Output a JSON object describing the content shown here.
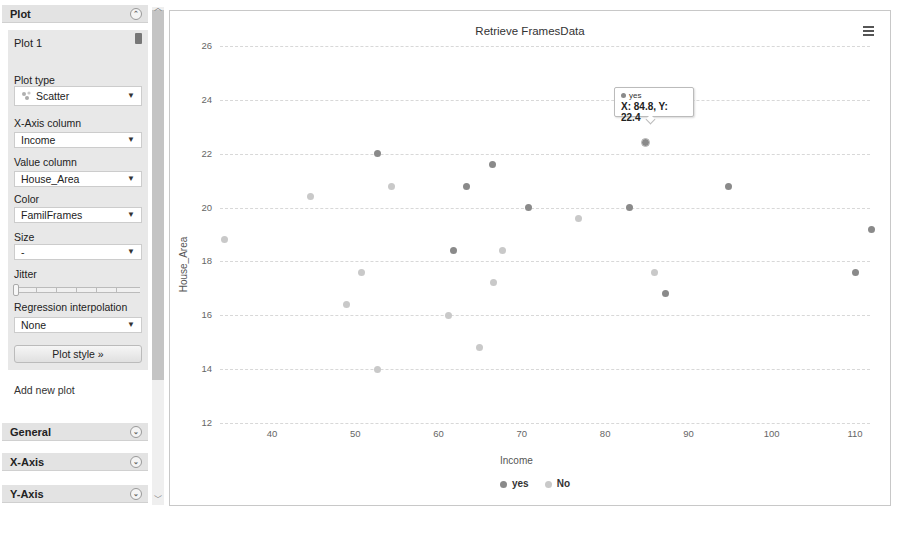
{
  "sidebar": {
    "plot_header": "Plot",
    "plot1": {
      "title": "Plot 1",
      "plot_type_label": "Plot type",
      "plot_type_value": "Scatter",
      "x_axis_column_label": "X-Axis column",
      "x_axis_column_value": "Income",
      "value_column_label": "Value column",
      "value_column_value": "House_Area",
      "color_label": "Color",
      "color_value": "FamilFrames",
      "size_label": "Size",
      "size_value": "-",
      "jitter_label": "Jitter",
      "regression_label": "Regression interpolation",
      "regression_value": "None",
      "plot_style_button": "Plot style »"
    },
    "add_new_plot": "Add new plot",
    "general_header": "General",
    "x_axis_header": "X-Axis",
    "y_axis_header": "Y-Axis",
    "dropdown_arrow": "▼",
    "expand_icon": "≈",
    "scroll_up": "⌃",
    "scroll_down": "⌄"
  },
  "chart_data": {
    "type": "scatter",
    "title": "Retrieve FramesData",
    "xlabel": "Income",
    "ylabel": "House_Area",
    "xlim": [
      33,
      112
    ],
    "ylim": [
      12,
      26
    ],
    "x_ticks": [
      40,
      50,
      60,
      70,
      80,
      90,
      100,
      110
    ],
    "y_ticks": [
      12,
      14,
      16,
      18,
      20,
      22,
      24,
      26
    ],
    "grid": true,
    "legend_position": "bottom",
    "colors": {
      "yes": "#8a8a8a",
      "No": "#c9c9c9"
    },
    "series": [
      {
        "name": "yes",
        "points": [
          [
            110.0,
            17.6
          ],
          [
            87.3,
            16.8
          ],
          [
            112.0,
            19.2
          ],
          [
            82.9,
            20.0
          ],
          [
            94.8,
            20.8
          ],
          [
            61.8,
            18.4
          ],
          [
            70.8,
            20.0
          ],
          [
            63.3,
            20.8
          ],
          [
            66.5,
            21.6
          ],
          [
            52.7,
            22.0
          ],
          [
            84.8,
            22.4
          ]
        ]
      },
      {
        "name": "No",
        "points": [
          [
            85.9,
            17.6
          ],
          [
            76.8,
            19.6
          ],
          [
            52.7,
            14.0
          ],
          [
            64.9,
            14.8
          ],
          [
            61.2,
            16.0
          ],
          [
            48.9,
            16.4
          ],
          [
            66.6,
            17.2
          ],
          [
            50.8,
            17.6
          ],
          [
            67.7,
            18.4
          ],
          [
            34.3,
            18.8
          ],
          [
            44.6,
            20.4
          ],
          [
            54.4,
            20.8
          ]
        ]
      }
    ],
    "tooltip": {
      "series": "yes",
      "text": "X: 84.8, Y: 22.4",
      "x": 84.8,
      "y": 22.4
    }
  }
}
